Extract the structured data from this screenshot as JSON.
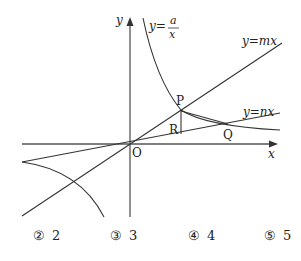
{
  "figure": {
    "axes": {
      "x_label": "x",
      "y_label": "y",
      "origin_label": "O"
    },
    "curves": [
      {
        "name": "hyperbola",
        "label_prefix": "y=",
        "numerator": "a",
        "denominator": "x"
      },
      {
        "name": "line-mx",
        "label": "y=mx"
      },
      {
        "name": "line-nx",
        "label": "y=nx"
      }
    ],
    "points": [
      {
        "name": "P",
        "label": "P"
      },
      {
        "name": "Q",
        "label": "Q"
      },
      {
        "name": "R",
        "label": "R"
      }
    ],
    "colors": {
      "stroke": "#333333",
      "axis": "#555555"
    }
  },
  "choices": [
    {
      "num": "②",
      "value": "2"
    },
    {
      "num": "③",
      "value": "3"
    },
    {
      "num": "④",
      "value": "4"
    },
    {
      "num": "⑤",
      "value": "5"
    }
  ]
}
